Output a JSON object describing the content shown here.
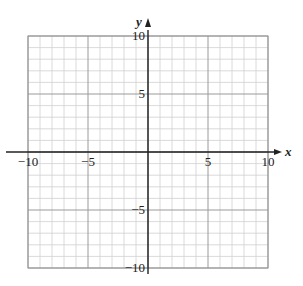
{
  "chart_data": {
    "type": "scatter",
    "title": "",
    "xlabel": "x",
    "ylabel": "y",
    "xlim": [
      -10,
      10
    ],
    "ylim": [
      -10,
      10
    ],
    "grid": true,
    "grid_minor_step": 1,
    "grid_major_step": 5,
    "x_ticks": [
      -10,
      -5,
      5,
      10
    ],
    "y_ticks": [
      10,
      5,
      -5,
      -10
    ],
    "x_tick_labels": [
      "−10",
      "−5",
      "5",
      "10"
    ],
    "y_tick_labels": [
      "10",
      "5",
      "−5",
      "−10"
    ],
    "series": [],
    "legend": null
  },
  "colors": {
    "minor_grid": "#d0d0d0",
    "major_grid": "#9a9a9a",
    "axis": "#222222",
    "background": "#ffffff"
  }
}
